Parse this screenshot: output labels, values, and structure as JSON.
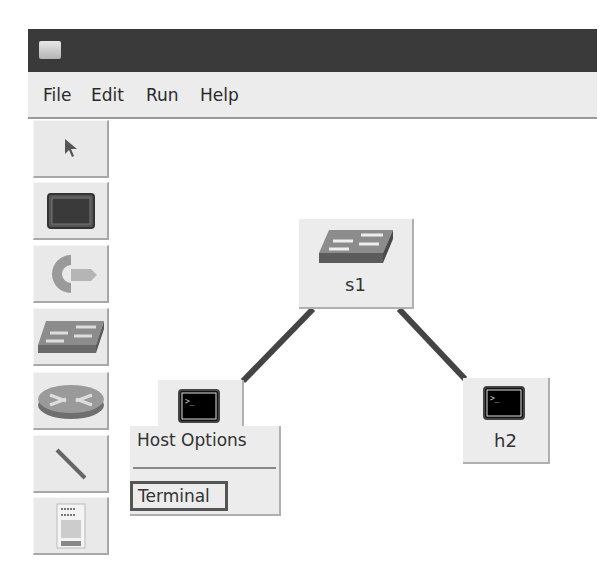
{
  "window": {
    "title": ""
  },
  "menubar": {
    "items": [
      {
        "label": "File"
      },
      {
        "label": "Edit"
      },
      {
        "label": "Run"
      },
      {
        "label": "Help"
      }
    ]
  },
  "toolbar": {
    "tools": [
      {
        "name": "select",
        "icon": "pointer-arrow-icon"
      },
      {
        "name": "host",
        "icon": "terminal-host-icon"
      },
      {
        "name": "controller",
        "icon": "controller-icon"
      },
      {
        "name": "switch",
        "icon": "switch-icon"
      },
      {
        "name": "router",
        "icon": "router-icon"
      },
      {
        "name": "link",
        "icon": "link-line-icon"
      },
      {
        "name": "netlink",
        "icon": "document-icon"
      }
    ]
  },
  "canvas": {
    "nodes": [
      {
        "id": "s1",
        "label": "s1",
        "type": "switch"
      },
      {
        "id": "h1",
        "label": "h1",
        "type": "host"
      },
      {
        "id": "h2",
        "label": "h2",
        "type": "host"
      }
    ],
    "links": [
      {
        "from": "s1",
        "to": "h1"
      },
      {
        "from": "s1",
        "to": "h2"
      }
    ]
  },
  "context_menu": {
    "title": "Host Options",
    "items": [
      {
        "label": "Terminal",
        "highlighted": true
      }
    ]
  },
  "colors": {
    "titlebar": "#3a3a3a",
    "menubar": "#ececec",
    "link": "#444444"
  }
}
